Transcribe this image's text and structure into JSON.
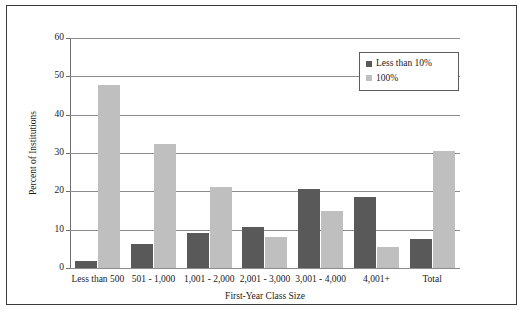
{
  "chart_data": {
    "type": "bar",
    "title": "",
    "xlabel": "First-Year Class Size",
    "ylabel": "Percent of Institutions",
    "ylim": [
      0,
      60
    ],
    "ytick_step": 10,
    "yticks": [
      0,
      10,
      20,
      30,
      40,
      50,
      60
    ],
    "ytick_labels": [
      "0",
      "10",
      "20",
      "30",
      "40",
      "50",
      "60"
    ],
    "grid": "horizontal",
    "legend_position": "upper right",
    "categories": [
      "Less than 500",
      "501 - 1,000",
      "1,001 - 2,000",
      "2,001 - 3,000",
      "3,001 - 4,000",
      "4,001+",
      "Total"
    ],
    "series": [
      {
        "name": "Less than 10%",
        "color": "#595959",
        "values": [
          1.9,
          6.2,
          9.1,
          10.8,
          20.5,
          18.5,
          7.6
        ]
      },
      {
        "name": "100%",
        "color": "#bfbfbf",
        "values": [
          47.7,
          32.3,
          21.2,
          8.0,
          14.8,
          5.5,
          30.6
        ]
      }
    ]
  },
  "legend": {
    "entries": [
      {
        "label": "Less than 10%"
      },
      {
        "label": "100%"
      }
    ]
  },
  "colors": {
    "series_dark": "#595959",
    "series_light": "#bfbfbf",
    "gridline": "#8c8c8c",
    "frame": "#3a3a3a",
    "background": "#ffffff"
  }
}
